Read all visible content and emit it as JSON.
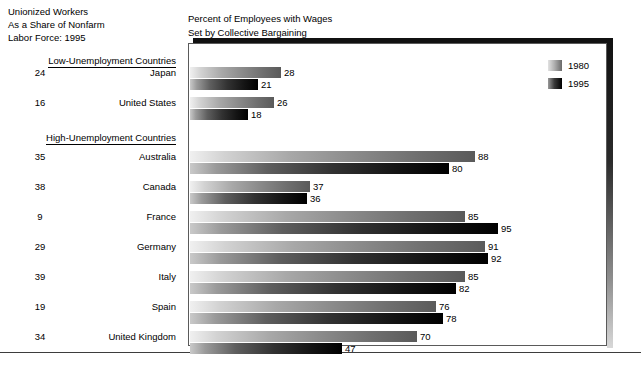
{
  "headings": {
    "left_title": "Unionized Workers\nAs a Share of Nonfarm\nLabor Force: 1995",
    "right_title": "Percent of Employees with Wages\nSet by Collective Bargaining"
  },
  "legend": {
    "items": [
      {
        "label": "1980",
        "swatch": "gray-gradient-light-swatch"
      },
      {
        "label": "1995",
        "swatch": "gray-gradient-dark-swatch"
      }
    ]
  },
  "groups": [
    {
      "heading": "Low-Unemployment Countries"
    },
    {
      "heading": "High-Unemployment Countries"
    }
  ],
  "chart_data": {
    "type": "bar",
    "title": "Percent of Employees with Wages Set by Collective Bargaining",
    "subtitle": "Unionized Workers As a Share of Nonfarm Labor Force: 1995",
    "orientation": "horizontal",
    "xlabel": "",
    "ylabel": "",
    "xlim": [
      0,
      100
    ],
    "grid": false,
    "legend_position": "top-right",
    "categories": [
      "Japan",
      "United States",
      "Australia",
      "Canada",
      "France",
      "Germany",
      "Italy",
      "Spain",
      "United Kingdom"
    ],
    "groups": {
      "Low-Unemployment Countries": [
        "Japan",
        "United States"
      ],
      "High-Unemployment Countries": [
        "Australia",
        "Canada",
        "France",
        "Germany",
        "Italy",
        "Spain",
        "United Kingdom"
      ]
    },
    "series": [
      {
        "name": "1980",
        "values": [
          28,
          26,
          88,
          37,
          85,
          91,
          85,
          76,
          70
        ]
      },
      {
        "name": "1995",
        "values": [
          21,
          18,
          80,
          36,
          95,
          92,
          82,
          78,
          47
        ]
      }
    ],
    "union_share_1995": {
      "name": "Unionized Workers As a Share of Nonfarm Labor Force: 1995",
      "values": [
        24,
        16,
        35,
        38,
        9,
        29,
        39,
        19,
        34
      ]
    }
  },
  "rows": [
    {
      "pct": "24",
      "country": "Japan",
      "v1980": "28",
      "v1995": "21"
    },
    {
      "pct": "16",
      "country": "United States",
      "v1980": "26",
      "v1995": "18"
    },
    {
      "pct": "35",
      "country": "Australia",
      "v1980": "88",
      "v1995": "80"
    },
    {
      "pct": "38",
      "country": "Canada",
      "v1980": "37",
      "v1995": "36"
    },
    {
      "pct": "9",
      "country": "France",
      "v1980": "85",
      "v1995": "95"
    },
    {
      "pct": "29",
      "country": "Germany",
      "v1980": "91",
      "v1995": "92"
    },
    {
      "pct": "39",
      "country": "Italy",
      "v1980": "85",
      "v1995": "82"
    },
    {
      "pct": "19",
      "country": "Spain",
      "v1980": "76",
      "v1995": "78"
    },
    {
      "pct": "34",
      "country": "United Kingdom",
      "v1980": "70",
      "v1995": "47"
    }
  ]
}
